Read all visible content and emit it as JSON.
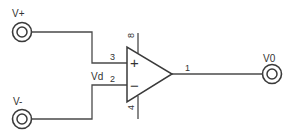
{
  "diagram": {
    "type": "op-amp schematic",
    "terminals": {
      "v_plus": {
        "label": "V+"
      },
      "v_minus": {
        "label": "V-"
      },
      "v_out": {
        "label": "V0"
      }
    },
    "differential_label": "Vd",
    "opamp": {
      "non_inverting_sign": "+",
      "inverting_sign": "−",
      "pins": {
        "non_inverting": "3",
        "inverting": "2",
        "output": "1",
        "supply_top": "8",
        "supply_bottom": "4"
      }
    },
    "colors": {
      "line": "#4a4a4a",
      "background": "#ffffff"
    }
  }
}
